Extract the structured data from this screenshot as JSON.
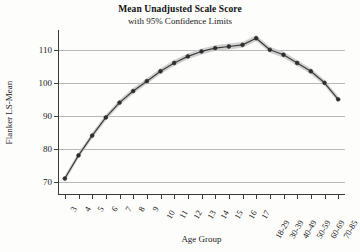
{
  "chart_data": {
    "type": "line",
    "title": "Mean Unadjusted Scale Score",
    "subtitle": "with 95% Confidence Limits",
    "xlabel": "Age Group",
    "ylabel": "Flanker LS-Mean",
    "categories": [
      "3",
      "4",
      "5",
      "6",
      "7",
      "8",
      "9",
      "10",
      "11",
      "12",
      "13",
      "14",
      "15",
      "16",
      "17",
      "18-29",
      "30-39",
      "40-49",
      "50-59",
      "60-69",
      "70-85"
    ],
    "values": [
      71.0,
      78.0,
      84.0,
      89.5,
      94.0,
      97.5,
      100.5,
      103.5,
      106.0,
      108.0,
      109.5,
      110.5,
      111.0,
      111.5,
      113.5,
      110.0,
      108.5,
      106.0,
      103.5,
      100.0,
      95.0
    ],
    "series": [
      {
        "name": "Flanker LS-Mean",
        "values": [
          71.0,
          78.0,
          84.0,
          89.5,
          94.0,
          97.5,
          100.5,
          103.5,
          106.0,
          108.0,
          109.5,
          110.5,
          111.0,
          111.5,
          113.5,
          110.0,
          108.5,
          106.0,
          103.5,
          100.0,
          95.0
        ]
      }
    ],
    "confidence_band": {
      "label": "95% Confidence Limits",
      "visible": true,
      "approx_half_width": 0.9
    },
    "ylim": [
      66,
      116
    ],
    "yticks": [
      70,
      80,
      90,
      100,
      110
    ],
    "ytick_labels": [
      "70",
      "80",
      "90",
      "100",
      "110"
    ],
    "grid": true,
    "grid_axis": "y",
    "legend": "none",
    "marker": "filled-circle",
    "line_color": "#3c3c3c",
    "band_color": "#c8c8c8",
    "grid_color": "#b9b9b9"
  },
  "figure": {
    "background": "#fdfdfc"
  }
}
